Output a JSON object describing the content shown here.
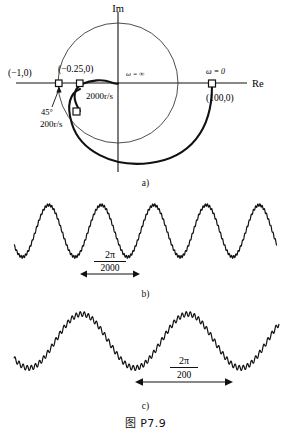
{
  "figure": {
    "caption": "图 P7.9",
    "panels": [
      {
        "key": "a",
        "label": "a)"
      },
      {
        "key": "b",
        "label": "b)"
      },
      {
        "key": "c",
        "label": "c)"
      }
    ]
  },
  "chart_data": [
    {
      "type": "scatter",
      "id": "nyquist-plot",
      "title": "",
      "xlabel": "Re",
      "ylabel": "Im",
      "grid": false,
      "legend": null,
      "axes": {
        "real_label": "Re",
        "imag_label": "Im"
      },
      "annotations": [
        {
          "name": "point-minus-one",
          "text": "(−1,0)",
          "x": -1.0,
          "y": 0.0
        },
        {
          "name": "point-minus-quarter",
          "text": "(−0.25,0)",
          "x": -0.25,
          "y": 0.0
        },
        {
          "name": "omega-infinity",
          "text": "ω = ∞",
          "x": 0.0,
          "y": 0.0
        },
        {
          "name": "omega-zero",
          "text": "ω = 0",
          "x": 100.0,
          "y": 0.0
        },
        {
          "name": "point-hundred",
          "text": "(100,0)",
          "x": 100.0,
          "y": 0.0
        },
        {
          "name": "marker-2000",
          "text": "2000r/s",
          "x": -0.25,
          "y": 0.0
        },
        {
          "name": "marker-200",
          "text": "200r/s",
          "x": -0.55,
          "y": -0.6
        },
        {
          "name": "phase-margin",
          "text": "45°",
          "x": -0.9,
          "y": -0.35
        }
      ],
      "markers": [
        {
          "name": "marker-minus-one",
          "label": "(−1,0)",
          "shape": "open-square"
        },
        {
          "name": "marker-2000rs",
          "label": "2000r/s",
          "shape": "open-square"
        },
        {
          "name": "marker-200rs",
          "label": "200r/s",
          "shape": "open-square"
        },
        {
          "name": "marker-omega-0",
          "label": "ω = 0",
          "shape": "open-square"
        }
      ],
      "unit_circle": {
        "center": [
          0,
          0
        ],
        "radius": 1.0,
        "stroke": "thin"
      }
    },
    {
      "type": "line",
      "id": "waveform-b",
      "title": "",
      "xlabel": "",
      "ylabel": "",
      "grid": false,
      "period_label_numerator": "2π",
      "period_label_denominator": "2000",
      "cycles": 5,
      "fundamental_frequency": 2000,
      "ripple": {
        "present": true,
        "relative_frequency": 24,
        "relative_amplitude": 0.05
      }
    },
    {
      "type": "line",
      "id": "waveform-c",
      "title": "",
      "xlabel": "",
      "ylabel": "",
      "grid": false,
      "period_label_numerator": "2π",
      "period_label_denominator": "200",
      "cycles": 2.5,
      "fundamental_frequency": 200,
      "ripple": {
        "present": true,
        "relative_frequency": 26,
        "relative_amplitude": 0.09
      }
    }
  ],
  "colors": {
    "ink": "#111111",
    "thin_line": "#3a3a3a",
    "paper": "#ffffff"
  }
}
